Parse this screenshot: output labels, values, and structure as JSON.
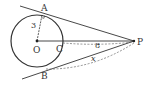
{
  "diagram": {
    "type": "geometry",
    "points": {
      "O": {
        "label": "O",
        "x": 37,
        "y": 41
      },
      "A": {
        "label": "A",
        "x": 42,
        "y": 15
      },
      "B": {
        "label": "B",
        "x": 46,
        "y": 67
      },
      "C": {
        "label": "C",
        "x": 63,
        "y": 41
      },
      "P": {
        "label": "P",
        "x": 134,
        "y": 41
      }
    },
    "circle": {
      "center": "O",
      "radius": 26
    },
    "labels": {
      "radius": "3",
      "cp_length": "8",
      "pb_length": "x"
    },
    "colors": {
      "line": "#333333",
      "dashed": "#666666"
    }
  }
}
